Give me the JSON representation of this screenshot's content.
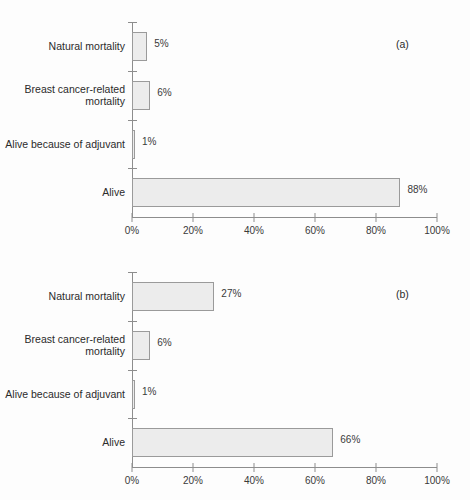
{
  "figure": {
    "background": "#fdfdfd",
    "bar_fill": "#ececec",
    "bar_stroke": "#9a9a9a",
    "axis_color": "#8d8d8d"
  },
  "chart_data": [
    {
      "type": "bar",
      "orientation": "horizontal",
      "panel_label": "(a)",
      "title": "",
      "xlabel": "",
      "ylabel": "",
      "xlim": [
        0,
        100
      ],
      "grid": false,
      "legend": null,
      "tick_labels": [
        "0%",
        "20%",
        "40%",
        "60%",
        "80%",
        "100%"
      ],
      "ticks": [
        0,
        20,
        40,
        60,
        80,
        100
      ],
      "categories": [
        "Natural mortality",
        "Breast cancer-related\nmortality",
        "Alive because of adjuvant",
        "Alive"
      ],
      "values": [
        5,
        6,
        1,
        88
      ],
      "value_labels": [
        "5%",
        "6%",
        "1%",
        "88%"
      ]
    },
    {
      "type": "bar",
      "orientation": "horizontal",
      "panel_label": "(b)",
      "title": "",
      "xlabel": "",
      "ylabel": "",
      "xlim": [
        0,
        100
      ],
      "grid": false,
      "legend": null,
      "tick_labels": [
        "0%",
        "20%",
        "40%",
        "60%",
        "80%",
        "100%"
      ],
      "ticks": [
        0,
        20,
        40,
        60,
        80,
        100
      ],
      "categories": [
        "Natural mortality",
        "Breast cancer-related\nmortality",
        "Alive because of adjuvant",
        "Alive"
      ],
      "values": [
        27,
        6,
        1,
        66
      ],
      "value_labels": [
        "27%",
        "6%",
        "1%",
        "66%"
      ]
    }
  ]
}
